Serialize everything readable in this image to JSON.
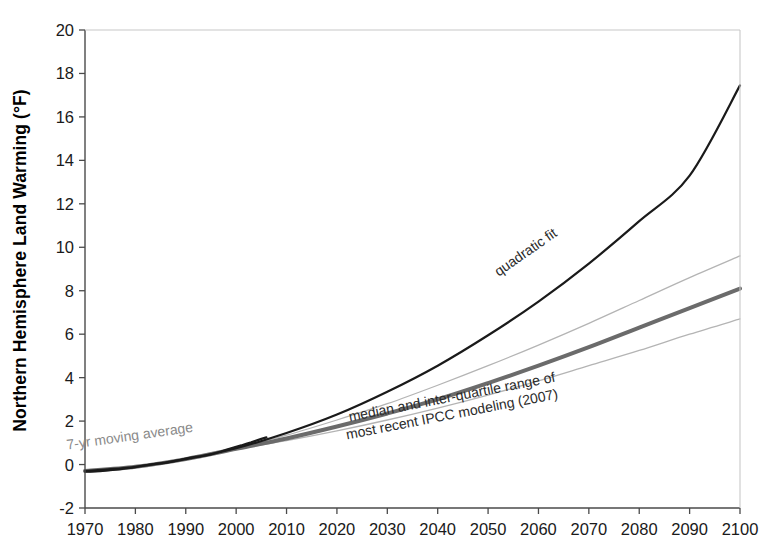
{
  "chart_data": {
    "type": "line",
    "title": "",
    "xlabel": "",
    "ylabel": "Northern Hemisphere Land Warming (°F)",
    "xlim": [
      1970,
      2100
    ],
    "ylim": [
      -2,
      20
    ],
    "grid": false,
    "legend_position": "inline-annotations",
    "xticks": [
      1970,
      1980,
      1990,
      2000,
      2010,
      2020,
      2030,
      2040,
      2050,
      2060,
      2070,
      2080,
      2090,
      2100
    ],
    "yticks": [
      -2,
      0,
      2,
      4,
      6,
      8,
      10,
      12,
      14,
      16,
      18,
      20
    ],
    "annotations": [
      {
        "name": "quadratic-fit-label",
        "text": "quadratic fit",
        "x": 2058,
        "y": 9.6,
        "rotation": -35,
        "color": "#2b2b2b"
      },
      {
        "name": "moving-average-label",
        "text": "7-yr moving average",
        "x": 1979,
        "y": 1.1,
        "rotation": -8,
        "color": "#8a8a8a"
      },
      {
        "name": "ipcc-label-line1",
        "text": "median and inter-quartile range of",
        "x": 2043,
        "y": 2.9,
        "rotation": -11,
        "color": "#2b2b2b"
      },
      {
        "name": "ipcc-label-line2",
        "text": "most recent IPCC modeling (2007)",
        "x": 2043,
        "y": 2.1,
        "rotation": -11,
        "color": "#2b2b2b"
      }
    ],
    "series": [
      {
        "name": "7-yr moving average",
        "style": "solid",
        "color": "#1a1a1a",
        "width": 2.2,
        "x": [
          1970,
          1971,
          1972,
          1973,
          1974,
          1975,
          1976,
          1977,
          1978,
          1979,
          1980,
          1981,
          1982,
          1983,
          1984,
          1985,
          1986,
          1987,
          1988,
          1989,
          1990,
          1991,
          1992,
          1993,
          1994,
          1995,
          1996,
          1997,
          1998,
          1999,
          2000,
          2001,
          2002,
          2003,
          2004,
          2005,
          2006
        ],
        "values": [
          -0.32,
          -0.33,
          -0.31,
          -0.3,
          -0.28,
          -0.26,
          -0.24,
          -0.21,
          -0.18,
          -0.16,
          -0.12,
          -0.08,
          -0.04,
          0.0,
          0.03,
          0.05,
          0.08,
          0.12,
          0.17,
          0.22,
          0.28,
          0.32,
          0.35,
          0.38,
          0.42,
          0.47,
          0.53,
          0.6,
          0.68,
          0.75,
          0.82,
          0.88,
          0.95,
          1.02,
          1.1,
          1.18,
          1.25
        ]
      },
      {
        "name": "quadratic fit",
        "style": "solid",
        "color": "#1a1a1a",
        "width": 2.2,
        "x": [
          1970,
          1980,
          1990,
          2000,
          2010,
          2020,
          2030,
          2040,
          2050,
          2060,
          2070,
          2080,
          2090,
          2100
        ],
        "values": [
          -0.3,
          -0.1,
          0.25,
          0.75,
          1.45,
          2.3,
          3.35,
          4.55,
          5.95,
          7.5,
          9.25,
          11.2,
          13.3,
          17.45
        ]
      },
      {
        "name": "IPCC median",
        "style": "solid",
        "color": "#6b6b6b",
        "width": 4.0,
        "x": [
          1970,
          1980,
          1990,
          2000,
          2010,
          2020,
          2030,
          2040,
          2050,
          2060,
          2070,
          2080,
          2090,
          2100
        ],
        "values": [
          -0.3,
          -0.1,
          0.25,
          0.72,
          1.2,
          1.75,
          2.35,
          3.0,
          3.75,
          4.55,
          5.4,
          6.3,
          7.2,
          8.1
        ]
      },
      {
        "name": "IPCC upper quartile",
        "style": "solid",
        "color": "#b4b4b4",
        "width": 1.3,
        "x": [
          1970,
          1980,
          1990,
          2000,
          2010,
          2020,
          2030,
          2040,
          2050,
          2060,
          2070,
          2080,
          2090,
          2100
        ],
        "values": [
          -0.3,
          -0.1,
          0.25,
          0.75,
          1.35,
          2.05,
          2.8,
          3.65,
          4.55,
          5.5,
          6.5,
          7.55,
          8.6,
          9.6
        ]
      },
      {
        "name": "IPCC lower quartile",
        "style": "solid",
        "color": "#b4b4b4",
        "width": 1.3,
        "x": [
          1970,
          1980,
          1990,
          2000,
          2010,
          2020,
          2030,
          2040,
          2050,
          2060,
          2070,
          2080,
          2090,
          2100
        ],
        "values": [
          -0.3,
          -0.1,
          0.25,
          0.7,
          1.1,
          1.55,
          2.05,
          2.6,
          3.2,
          3.85,
          4.55,
          5.25,
          6.0,
          6.7
        ]
      }
    ]
  },
  "axes": {
    "y_title": "Northern Hemisphere Land Warming (°F)"
  }
}
